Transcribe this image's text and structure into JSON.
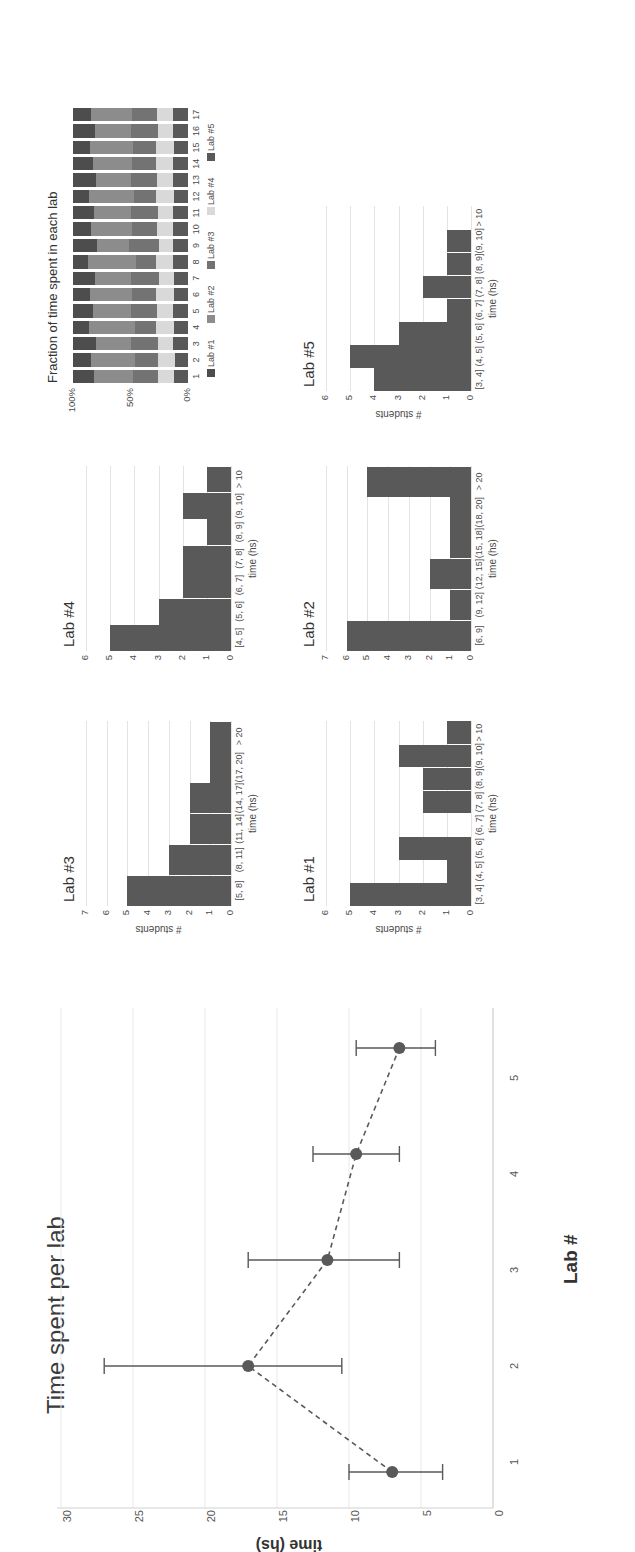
{
  "figure": {
    "orientation": "rotated-90-ccw"
  },
  "main_chart": {
    "title": "Time spent per lab",
    "xlabel": "Lab #",
    "ylabel": "time (hs)",
    "yticks": [
      "0",
      "5",
      "10",
      "15",
      "20",
      "25",
      "30"
    ],
    "xticks": [
      "1",
      "2",
      "3",
      "4",
      "5"
    ]
  },
  "panels": {
    "lab1": {
      "title": "Lab #1",
      "xlabel": "time (hs)",
      "ylabel": "# students",
      "yticks": [
        "0",
        "1",
        "2",
        "3",
        "4",
        "5",
        "6"
      ]
    },
    "lab2": {
      "title": "Lab #2",
      "xlabel": "time (hs)",
      "ylabel": "",
      "yticks": [
        "0",
        "1",
        "2",
        "3",
        "4",
        "5",
        "6",
        "7"
      ]
    },
    "lab3": {
      "title": "Lab #3",
      "xlabel": "time (hs)",
      "ylabel": "# students",
      "yticks": [
        "0",
        "1",
        "2",
        "3",
        "4",
        "5",
        "6",
        "7"
      ]
    },
    "lab4": {
      "title": "Lab #4",
      "xlabel": "time (hs)",
      "ylabel": "",
      "yticks": [
        "0",
        "1",
        "2",
        "3",
        "4",
        "5",
        "6"
      ]
    },
    "lab5": {
      "title": "Lab #5",
      "xlabel": "time (hs)",
      "ylabel": "# students",
      "yticks": [
        "0",
        "1",
        "2",
        "3",
        "4",
        "5",
        "6"
      ]
    },
    "stacked": {
      "title": "Fraction of time spent in each lab",
      "yticks": [
        "0%",
        "50%",
        "100%"
      ]
    }
  },
  "chart_data": [
    {
      "type": "line",
      "title": "Time spent per lab",
      "xlabel": "Lab #",
      "ylabel": "time (hs)",
      "x": [
        1,
        2,
        3,
        4,
        5
      ],
      "xticklabels": [
        "1",
        "2",
        "3",
        "4",
        "5"
      ],
      "values": [
        7,
        17,
        11.5,
        9.5,
        6.5
      ],
      "error_low": [
        3.5,
        6.5,
        5,
        3,
        2.5
      ],
      "error_high": [
        3,
        10,
        5.5,
        3,
        3
      ],
      "ylim": [
        0,
        30
      ],
      "yticks": [
        0,
        5,
        10,
        15,
        20,
        25,
        30
      ],
      "grid": true,
      "legend": "none",
      "marker": "circle",
      "linestyle": "dashed",
      "color": "#595959"
    },
    {
      "type": "bar",
      "title": "Lab #1",
      "xlabel": "time (hs)",
      "ylabel": "# students",
      "categories": [
        "[3, 4]",
        "(4, 5]",
        "(5, 6]",
        "(6, 7]",
        "(7, 8]",
        "(8, 9]",
        "(9, 10]",
        "> 10"
      ],
      "values": [
        5,
        1,
        3,
        0,
        2,
        2,
        3,
        1
      ],
      "ylim": [
        0,
        6
      ],
      "yticks": [
        0,
        1,
        2,
        3,
        4,
        5,
        6
      ],
      "grid": true,
      "color": "#595959"
    },
    {
      "type": "bar",
      "title": "Lab #2",
      "xlabel": "time (hs)",
      "ylabel": "",
      "categories": [
        "[6, 9]",
        "(9, 12]",
        "(12, 15]",
        "(15, 18]",
        "(18, 20]",
        "> 20"
      ],
      "values": [
        6,
        1,
        2,
        1,
        1,
        5
      ],
      "ylim": [
        0,
        7
      ],
      "yticks": [
        0,
        1,
        2,
        3,
        4,
        5,
        6,
        7
      ],
      "grid": true,
      "color": "#595959"
    },
    {
      "type": "bar",
      "title": "Lab #3",
      "xlabel": "time (hs)",
      "ylabel": "# students",
      "categories": [
        "[5, 8]",
        "(8, 11]",
        "(11, 14]",
        "(14, 17]",
        "(17, 20]",
        "> 20"
      ],
      "values": [
        5,
        3,
        2,
        2,
        1,
        1
      ],
      "ylim": [
        0,
        7
      ],
      "yticks": [
        0,
        1,
        2,
        3,
        4,
        5,
        6,
        7
      ],
      "grid": true,
      "color": "#595959"
    },
    {
      "type": "bar",
      "title": "Lab #4",
      "xlabel": "time (hs)",
      "ylabel": "",
      "categories": [
        "[4, 5]",
        "(5, 6]",
        "(6, 7]",
        "(7, 8]",
        "(8, 9]",
        "(9, 10]",
        "> 10"
      ],
      "values": [
        5,
        3,
        2,
        2,
        1,
        2,
        1
      ],
      "ylim": [
        0,
        6
      ],
      "yticks": [
        0,
        1,
        2,
        3,
        4,
        5,
        6
      ],
      "grid": true,
      "color": "#595959"
    },
    {
      "type": "bar",
      "title": "Lab #5",
      "xlabel": "time (hs)",
      "ylabel": "# students",
      "categories": [
        "[3, 4]",
        "(4, 5]",
        "(5, 6]",
        "(6, 7]",
        "(7, 8]",
        "(8, 9]",
        "(9, 10]",
        "> 10"
      ],
      "values": [
        4,
        5,
        3,
        1,
        2,
        1,
        1,
        0
      ],
      "ylim": [
        0,
        6
      ],
      "yticks": [
        0,
        1,
        2,
        3,
        4,
        5,
        6
      ],
      "grid": true,
      "color": "#595959"
    },
    {
      "type": "bar",
      "title": "Fraction of time spent in each lab",
      "stacked": true,
      "xlabel": "",
      "ylabel": "",
      "categories": [
        "1",
        "2",
        "3",
        "4",
        "5",
        "6",
        "7",
        "8",
        "9",
        "10",
        "11",
        "12",
        "13",
        "14",
        "15",
        "16",
        "17"
      ],
      "yticklabels": [
        "0%",
        "50%",
        "100%"
      ],
      "ylim": [
        0,
        100
      ],
      "legend": [
        "Lab #1",
        "Lab #2",
        "Lab #3",
        "Lab #4",
        "Lab #5"
      ],
      "legend_position": "bottom",
      "colors": [
        "#4d4d4d",
        "#8c8c8c",
        "#737373",
        "#d9d9d9",
        "#595959"
      ],
      "series": [
        {
          "name": "Lab #1",
          "values": [
            18,
            16,
            20,
            14,
            17,
            15,
            19,
            13,
            21,
            16,
            18,
            14,
            20,
            17,
            15,
            19,
            16
          ]
        },
        {
          "name": "Lab #2",
          "values": [
            34,
            38,
            30,
            40,
            33,
            36,
            31,
            42,
            28,
            35,
            32,
            39,
            30,
            34,
            37,
            31,
            35
          ]
        },
        {
          "name": "Lab #3",
          "values": [
            22,
            20,
            24,
            18,
            23,
            21,
            25,
            17,
            26,
            22,
            24,
            19,
            23,
            21,
            20,
            24,
            22
          ]
        },
        {
          "name": "Lab #4",
          "values": [
            14,
            15,
            13,
            16,
            14,
            16,
            13,
            15,
            12,
            14,
            13,
            16,
            14,
            15,
            16,
            13,
            14
          ]
        },
        {
          "name": "Lab #5",
          "values": [
            12,
            11,
            13,
            12,
            13,
            12,
            12,
            13,
            13,
            13,
            13,
            12,
            13,
            13,
            12,
            13,
            13
          ]
        }
      ]
    }
  ]
}
